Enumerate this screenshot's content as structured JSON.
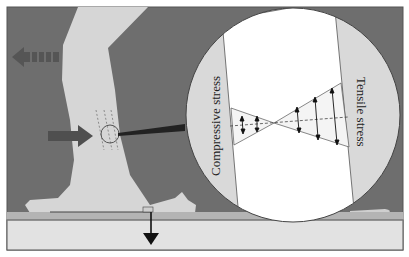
{
  "figure": {
    "labels": {
      "compressive": "Compressive stress",
      "tensile": "Tensile stress"
    },
    "colors": {
      "background": "#6e6e6e",
      "leg": "#d6d6d6",
      "ground_strip": "#b4b4b4",
      "ground": "#e2e2e2",
      "circle": "#d9d9d9",
      "band": "#ffffff",
      "arrow_dark": "#4a4a4a",
      "frame": "#555555"
    },
    "icons": {
      "motion_arrow": "dashed-left-arrow",
      "force_arrow": "right-arrow",
      "ground_reaction_arrow": "down-arrow",
      "magnifier": "zoom-circle"
    }
  }
}
